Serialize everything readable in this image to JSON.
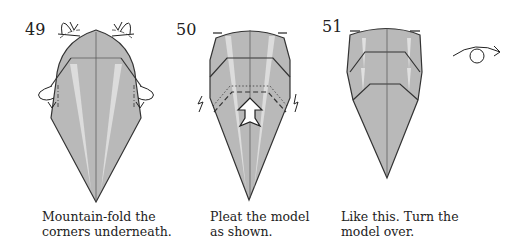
{
  "steps": [
    {
      "number": "49",
      "caption_line1": "Mountain-fold the",
      "caption_line2": "corners underneath.",
      "fold_type": "mountain-fold",
      "marks": [
        "mountain-fold-arrows-top-left",
        "mountain-fold-arrows-top-right",
        "mountain-fold-arrows-side-left",
        "mountain-fold-arrows-side-right"
      ]
    },
    {
      "number": "50",
      "caption_line1": "Pleat the model",
      "caption_line2": "as shown.",
      "fold_type": "pleat",
      "marks": [
        "push-arrow-up",
        "pleat-zigzag-left",
        "pleat-zigzag-right"
      ]
    },
    {
      "number": "51",
      "caption_line1": "Like this. Turn the",
      "caption_line2": "model over.",
      "fold_type": "turn-over",
      "marks": [
        "turn-over-symbol"
      ]
    }
  ],
  "colors": {
    "paper": "#b9b9b9",
    "highlight": "#e2e2e2",
    "line": "#333333",
    "background": "#ffffff"
  }
}
